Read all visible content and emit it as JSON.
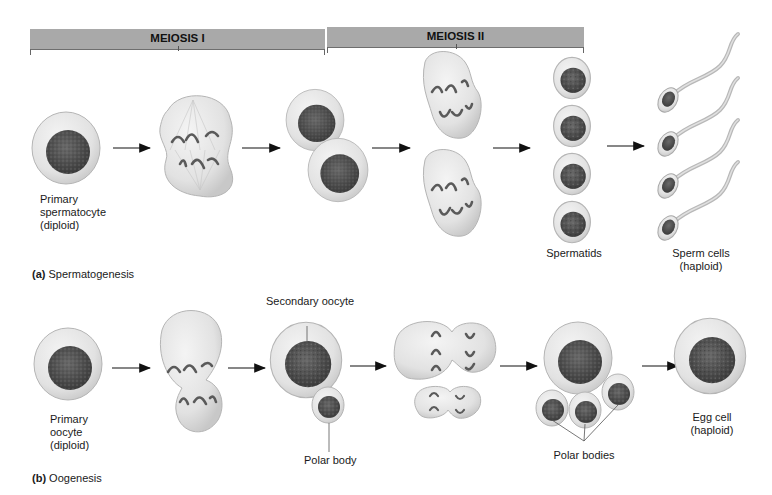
{
  "phases": {
    "meiosis1": {
      "label": "MEIOSIS I"
    },
    "meiosis2": {
      "label": "MEIOSIS II"
    }
  },
  "spermatogenesis": {
    "caption_letter": "(a)",
    "caption_text": "Spermatogenesis",
    "stages": [
      {
        "name": "primary-spermatocyte",
        "label_lines": [
          "Primary",
          "spermatocyte",
          "(diploid)"
        ]
      },
      {
        "name": "meiosis-i-division",
        "label_lines": []
      },
      {
        "name": "secondary-spermatocytes",
        "label_lines": []
      },
      {
        "name": "meiosis-ii-division",
        "label_lines": []
      },
      {
        "name": "spermatids",
        "label_lines": [
          "Spermatids"
        ]
      },
      {
        "name": "sperm-cells",
        "label_lines": [
          "Sperm cells",
          "(haploid)"
        ]
      }
    ]
  },
  "oogenesis": {
    "caption_letter": "(b)",
    "caption_text": "Oogenesis",
    "stages": [
      {
        "name": "primary-oocyte",
        "label_lines": [
          "Primary",
          "oocyte",
          "(diploid)"
        ]
      },
      {
        "name": "meiosis-i-unequal-division",
        "label_lines": []
      },
      {
        "name": "secondary-oocyte",
        "label_lines": [
          "Secondary oocyte"
        ],
        "sub_label": "Polar body"
      },
      {
        "name": "meiosis-ii-division",
        "label_lines": []
      },
      {
        "name": "egg-and-polar-bodies",
        "label_lines": [
          "Polar bodies"
        ]
      },
      {
        "name": "egg-cell",
        "label_lines": [
          "Egg cell",
          "(haploid)"
        ]
      }
    ]
  },
  "colors": {
    "phase_bar": "#a9a9a9",
    "cytoplasm": "#e4e4e4",
    "cell_outline": "#b5b5b5",
    "nucleus": "#4a4a4a",
    "chromosome": "#5a5a5a",
    "arrow": "#111111"
  }
}
